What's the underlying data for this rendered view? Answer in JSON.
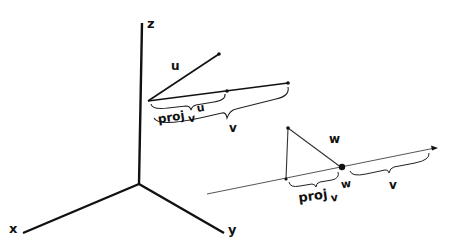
{
  "diagram": {
    "colors": {
      "ink": "#111111",
      "thin_line": "#555555",
      "background": "#ffffff"
    },
    "axes": {
      "x_label": "x",
      "y_label": "y",
      "z_label": "z"
    },
    "left_figure": {
      "u_label": "u",
      "v_label": "v",
      "proj_label": "proj",
      "proj_sub": "v",
      "proj_arg": "u"
    },
    "right_figure": {
      "w_label": "w",
      "v_label": "v",
      "proj_label": "proj",
      "proj_sub": "v",
      "proj_arg": "w"
    }
  }
}
